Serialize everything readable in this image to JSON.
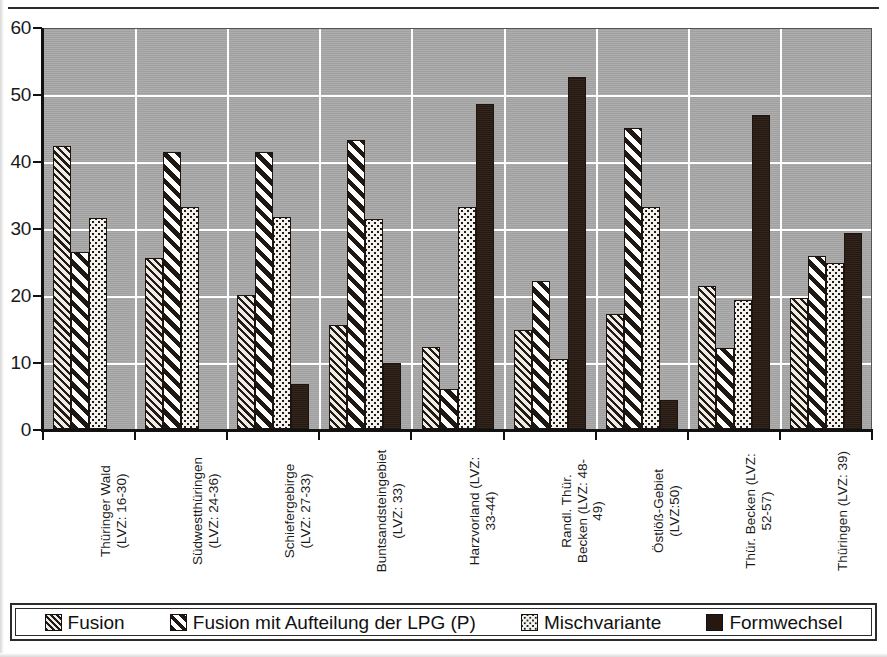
{
  "figure": {
    "top_rule_label": "",
    "background_color": "#a8a8a8",
    "gridline_color": "#ffffff",
    "axis_color": "#111111"
  },
  "yaxis": {
    "ticks": [
      "0",
      "10",
      "20",
      "30",
      "40",
      "50",
      "60"
    ],
    "min": 0,
    "max": 60,
    "step": 10
  },
  "legend": {
    "items": [
      {
        "label": "Fusion",
        "swatch": "hatch-fine-diagonal"
      },
      {
        "label": "Fusion mit Aufteilung der LPG (P)",
        "swatch": "hatch-bold-diagonal"
      },
      {
        "label": "Mischvariante",
        "swatch": "dotted-light"
      },
      {
        "label": "Formwechsel",
        "swatch": "solid-black"
      }
    ]
  },
  "categories": [
    {
      "line1": "Thüringer Wald",
      "line2": "(LVZ: 16-30)"
    },
    {
      "line1": "Südwestthüringen",
      "line2": "(LVZ: 24-36)"
    },
    {
      "line1": "Schiefergebirge",
      "line2": "(LVZ: 27-33)"
    },
    {
      "line1": "Buntsandsteingebiet",
      "line2": "(LVZ: 33)"
    },
    {
      "line1": "Harzvorland (LVZ:",
      "line2": "33-44)"
    },
    {
      "line1": "Randl. Thür.",
      "line2": "Becken (LVZ: 48-",
      "line3": "49)"
    },
    {
      "line1": "Östlöß-Gebiet",
      "line2": "(LVZ:50)"
    },
    {
      "line1": "Thür. Becken (LVZ:",
      "line2": "52-57)"
    },
    {
      "line1": "Thüringen (LVZ: 39)",
      "line2": ""
    }
  ],
  "chart_data": {
    "type": "bar",
    "title": "",
    "xlabel": "",
    "ylabel": "",
    "ylim": [
      0,
      60
    ],
    "ytick_step": 10,
    "grid": true,
    "legend_position": "bottom",
    "categories": [
      "Thüringer Wald (LVZ: 16-30)",
      "Südwestthüringen (LVZ: 24-36)",
      "Schiefergebirge (LVZ: 27-33)",
      "Buntsandsteingebiet (LVZ: 33)",
      "Harzvorland (LVZ: 33-44)",
      "Randl. Thür. Becken (LVZ: 48-49)",
      "Östlöß-Gebiet (LVZ:50)",
      "Thür. Becken (LVZ: 52-57)",
      "Thüringen (LVZ: 39)"
    ],
    "series": [
      {
        "name": "Fusion",
        "values": [
          42.3,
          25.5,
          20.0,
          15.5,
          12.2,
          14.8,
          17.1,
          21.3,
          19.5
        ]
      },
      {
        "name": "Fusion mit Aufteilung der LPG (P)",
        "values": [
          26.4,
          41.3,
          41.4,
          43.1,
          6.0,
          22.1,
          44.9,
          12.1,
          25.8
        ]
      },
      {
        "name": "Mischvariante",
        "values": [
          31.5,
          33.2,
          31.7,
          31.4,
          33.1,
          10.4,
          33.1,
          19.3,
          24.8
        ]
      },
      {
        "name": "Formwechsel",
        "values": [
          0.0,
          0.0,
          6.7,
          9.9,
          48.5,
          52.5,
          4.4,
          46.8,
          29.3
        ]
      }
    ]
  }
}
